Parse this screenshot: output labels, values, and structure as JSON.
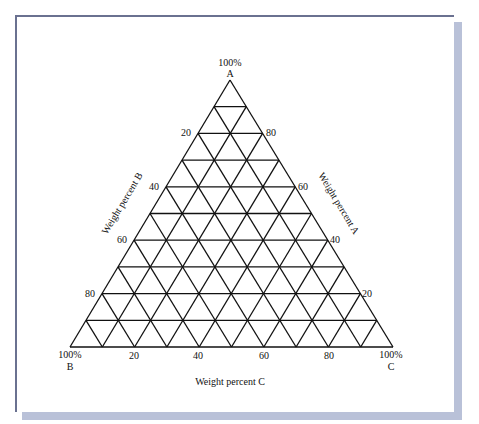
{
  "diagram": {
    "type": "ternary-phase-diagram",
    "divisions": 10,
    "geometry": {
      "apex": [
        230,
        80
      ],
      "bottom_left": [
        70,
        347
      ],
      "bottom_right": [
        393,
        347
      ]
    },
    "vertices": {
      "top": {
        "percent": "100%",
        "name": "A"
      },
      "bottom_left": {
        "percent": "100%",
        "name": "B"
      },
      "bottom_right": {
        "percent": "100%",
        "name": "C"
      }
    },
    "axes": {
      "left": {
        "title": "Weight percent B",
        "ticks": [
          "20",
          "40",
          "60",
          "80"
        ]
      },
      "right": {
        "title": "Weight percent A",
        "ticks": [
          "80",
          "60",
          "40",
          "20"
        ]
      },
      "bottom": {
        "title": "Weight percent C",
        "ticks": [
          "20",
          "40",
          "60",
          "80"
        ]
      }
    },
    "colors": {
      "line": "#111111",
      "frame_border": "#6a7190",
      "shadow": "#b9c1d8"
    }
  }
}
